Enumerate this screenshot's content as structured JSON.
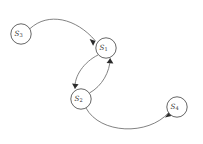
{
  "diagram": {
    "kind": "state-transition-diagram",
    "background_color": "#ffffff",
    "node_fill_color": "#ffffff",
    "node_stroke_color": "#555555",
    "edge_color": "#6b6b6b",
    "arrowhead_color": "#2b2b2b",
    "label_color": "#333333",
    "nodes": [
      {
        "id": "s3",
        "label": "S",
        "subscript": "3",
        "cx": 21,
        "cy": 34,
        "r": 10.2
      },
      {
        "id": "s1",
        "label": "S",
        "subscript": "1",
        "cx": 106,
        "cy": 48,
        "r": 10.2
      },
      {
        "id": "s2",
        "label": "S",
        "subscript": "2",
        "cx": 81,
        "cy": 99,
        "r": 10.2
      },
      {
        "id": "s4",
        "label": "S",
        "subscript": "4",
        "cx": 177,
        "cy": 107,
        "r": 10.2
      }
    ],
    "edges": [
      {
        "id": "edge-s3-s1",
        "from": "s3",
        "to": "s1",
        "directed": true,
        "path": "M 30.0 28.6 C 48 12 76 18 95.5 41.0",
        "arrow": "M 95.5 41.0 L 89.6 39.1 L 93.1 45.7 Z"
      },
      {
        "id": "edge-s1-s2",
        "from": "s1",
        "to": "s2",
        "directed": true,
        "path": "M 98.0 55.0 C 84 62 74 76 75.0 88.8",
        "arrow": "M 75.0 88.8 L 72.0 83.5 L 78.6 84.2 Z"
      },
      {
        "id": "edge-s2-s1",
        "from": "s2",
        "to": "s1",
        "directed": true,
        "path": "M 89.5 93.0 C 102 86 110 72 110.2 58.2",
        "arrow": "M 110.2 58.2 L 113.4 63.6 L 106.6 62.9 Z"
      },
      {
        "id": "edge-s2-s4",
        "from": "s2",
        "to": "s4",
        "directed": true,
        "path": "M 86.0 108.0 C 100 134 148 136 168.8 112.5",
        "arrow": "M 168.8 112.5 L 164.9 117.6 L 171.4 116.0 Z"
      }
    ]
  }
}
